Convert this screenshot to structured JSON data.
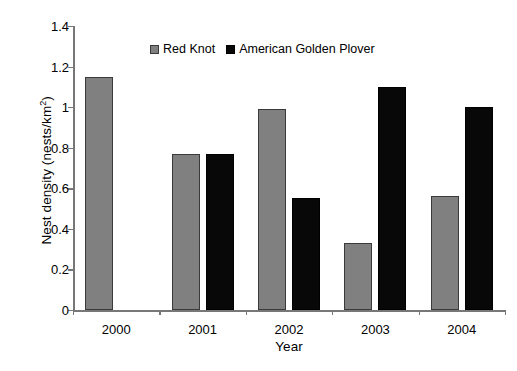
{
  "chart_data": {
    "type": "bar",
    "title": "",
    "subtitle": "",
    "xlabel": "Year",
    "ylabel": "Nest density (nests/km²)",
    "ylabel_base": "Nest density (nests/km",
    "ylabel_sup": "2",
    "ylabel_tail": ")",
    "categories": [
      "2000",
      "2001",
      "2002",
      "2003",
      "2004"
    ],
    "series": [
      {
        "name": "Red Knot",
        "color": "#808080",
        "values": [
          1.15,
          0.77,
          0.99,
          0.33,
          0.56
        ]
      },
      {
        "name": "American Golden Plover",
        "color": "#000000",
        "values": [
          null,
          0.77,
          0.55,
          1.1,
          1.0
        ]
      }
    ],
    "ylim": [
      0,
      1.4
    ],
    "yticks": [
      0,
      0.2,
      0.4,
      0.6,
      0.8,
      1,
      1.2,
      1.4
    ],
    "ytick_labels": [
      "0",
      "0.2",
      "0.4",
      "0.6",
      "0.8",
      "1",
      "1.2",
      "1.4"
    ],
    "grid": false,
    "legend_position": "top-center"
  }
}
